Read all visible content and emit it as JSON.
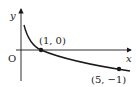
{
  "diagram": {
    "type": "function-graph",
    "axes": {
      "x_label": "x",
      "y_label": "y",
      "origin_label": "O"
    },
    "points": [
      {
        "label": "(1, 0)",
        "x": 1,
        "y": 0
      },
      {
        "label": "(5, −1)",
        "x": 5,
        "y": -1
      }
    ],
    "curve": "decreasing logarithmic curve through (1,0) and (5,-1), asymptotic to y-axis",
    "colors": {
      "stroke": "#1a1a1a",
      "background": "#ffffff"
    }
  }
}
